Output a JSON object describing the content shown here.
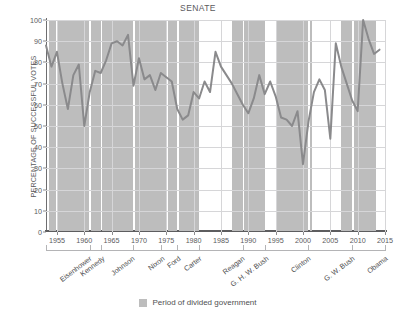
{
  "chart_data": {
    "type": "line",
    "title": "SENATE",
    "xlabel": "",
    "ylabel": "PERCENTAGE OF SUCCESSFUL VOTES",
    "ylim": [
      0,
      100
    ],
    "xlim": [
      1953,
      2015
    ],
    "ytick_labels": [
      "0",
      "10",
      "20",
      "30",
      "40",
      "50",
      "60",
      "70",
      "80",
      "90",
      "100"
    ],
    "ytick_values": [
      0,
      10,
      20,
      30,
      40,
      50,
      60,
      70,
      80,
      90,
      100
    ],
    "xtick_labels": [
      "1955",
      "1960",
      "1965",
      "1970",
      "1975",
      "1980",
      "1985",
      "1990",
      "1995",
      "2000",
      "2005",
      "2010",
      "2015"
    ],
    "xtick_values": [
      1955,
      1960,
      1965,
      1970,
      1975,
      1980,
      1985,
      1990,
      1995,
      2000,
      2005,
      2010,
      2015
    ],
    "grid": true,
    "legend_position": "bottom-center",
    "series": [
      {
        "name": "Percentage of successful votes",
        "color": "#8a8a8c",
        "x": [
          1953,
          1954,
          1955,
          1956,
          1957,
          1958,
          1959,
          1960,
          1961,
          1962,
          1963,
          1964,
          1965,
          1966,
          1967,
          1968,
          1969,
          1970,
          1971,
          1972,
          1973,
          1974,
          1975,
          1976,
          1977,
          1978,
          1979,
          1980,
          1981,
          1982,
          1983,
          1984,
          1985,
          1986,
          1987,
          1988,
          1989,
          1990,
          1991,
          1992,
          1993,
          1994,
          1995,
          1996,
          1997,
          1998,
          1999,
          2000,
          2001,
          2002,
          2003,
          2004,
          2005,
          2006,
          2007,
          2008,
          2009,
          2010,
          2011,
          2012,
          2013,
          2014
        ],
        "values": [
          88,
          78,
          85,
          70,
          58,
          74,
          79,
          50,
          66,
          76,
          75,
          81,
          89,
          90,
          88,
          93,
          69,
          82,
          72,
          74,
          67,
          75,
          73,
          71,
          58,
          53,
          55,
          66,
          63,
          71,
          66,
          85,
          78,
          74,
          70,
          65,
          60,
          56,
          63,
          74,
          65,
          71,
          64,
          54,
          53,
          50,
          57,
          32,
          52,
          66,
          72,
          67,
          44,
          89,
          78,
          70,
          62,
          57,
          100,
          91,
          84,
          86
        ],
        "annotations": []
      }
    ],
    "bands": {
      "label": "Period of divided government",
      "color": "#bdbdbd",
      "ranges": [
        [
          1953.6,
          1954.9
        ],
        [
          1955.1,
          1960.9
        ],
        [
          1961.3,
          1963.0
        ],
        [
          1963.3,
          1969.0
        ],
        [
          1969.3,
          1975.0
        ],
        [
          1975.3,
          1977.0
        ],
        [
          1977.4,
          1980.9
        ],
        [
          1987.0,
          1989.0
        ],
        [
          1989.3,
          1993.0
        ],
        [
          1995.0,
          2001.0
        ],
        [
          2001.2,
          2001.6
        ],
        [
          2007.0,
          2009.0
        ],
        [
          2009.3,
          2013.3
        ]
      ]
    },
    "president_axis": {
      "ticks": [
        1953,
        1961,
        1963,
        1969,
        1974,
        1977,
        1981,
        1989,
        1993,
        2001,
        2009,
        2015
      ],
      "labels": [
        {
          "name": "Eisenhower",
          "position": 1960.6
        },
        {
          "name": "Kennedy",
          "position": 1963.1
        },
        {
          "name": "Johnson",
          "position": 1968.6
        },
        {
          "name": "Nixon",
          "position": 1974.0
        },
        {
          "name": "Ford",
          "position": 1977.0
        },
        {
          "name": "Carter",
          "position": 1980.8
        },
        {
          "name": "Reagan",
          "position": 1988.6
        },
        {
          "name": "G. H. W. Bush",
          "position": 1993.0
        },
        {
          "name": "Clinton",
          "position": 2000.8
        },
        {
          "name": "G. W. Bush",
          "position": 2008.8
        },
        {
          "name": "Obama",
          "position": 2014.8
        }
      ]
    }
  },
  "legend": {
    "label": "Period of divided government"
  }
}
